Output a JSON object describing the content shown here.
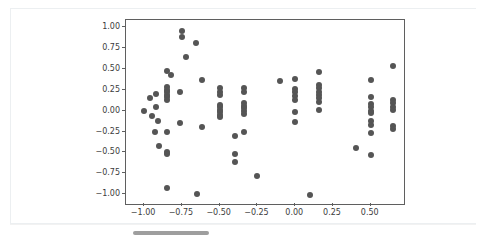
{
  "figure": {
    "background_color": "#ffffff",
    "card_border_color": "#eceff1",
    "axes_border_color": "#5f5f5f",
    "point_color": "#555555",
    "tick_label_color": "#3c3c3c"
  },
  "scrollbar": {
    "name": "horizontal-scrollbar",
    "thumb_color": "#9e9e9e"
  },
  "chart_data": {
    "type": "scatter",
    "title": "",
    "subtitle": "",
    "xlabel": "",
    "ylabel": "",
    "grid": false,
    "legend": null,
    "xlim": [
      -1.12,
      0.72
    ],
    "ylim": [
      -1.12,
      1.09
    ],
    "xticks": [
      -1.0,
      -0.75,
      -0.5,
      -0.25,
      0.0,
      0.25,
      0.5
    ],
    "xticklabels": [
      "−1.00",
      "−0.75",
      "−0.50",
      "−0.25",
      "0.00",
      "0.25",
      "0.50"
    ],
    "yticks": [
      -1.0,
      -0.75,
      -0.5,
      -0.25,
      0.0,
      0.25,
      0.5,
      0.75,
      1.0
    ],
    "yticklabels": [
      "−1.00",
      "−0.75",
      "−0.50",
      "−0.25",
      "0.00",
      "0.25",
      "0.50",
      "0.75",
      "1.00"
    ],
    "marker": "circle",
    "marker_size": 6,
    "marker_color": "#555555",
    "points": [
      [
        -1.0,
        0.0
      ],
      [
        -0.96,
        0.15
      ],
      [
        -0.95,
        -0.06
      ],
      [
        -0.92,
        0.2
      ],
      [
        -0.92,
        0.05
      ],
      [
        -0.91,
        -0.12
      ],
      [
        -0.93,
        -0.25
      ],
      [
        -0.9,
        -0.42
      ],
      [
        -0.85,
        0.48
      ],
      [
        -0.85,
        0.28
      ],
      [
        -0.85,
        0.25
      ],
      [
        -0.85,
        0.22
      ],
      [
        -0.85,
        0.19
      ],
      [
        -0.85,
        0.16
      ],
      [
        -0.85,
        0.13
      ],
      [
        -0.85,
        -0.25
      ],
      [
        -0.85,
        -0.5
      ],
      [
        -0.85,
        -0.52
      ],
      [
        -0.85,
        -0.93
      ],
      [
        -0.82,
        0.43
      ],
      [
        -0.75,
        0.96
      ],
      [
        -0.75,
        0.88
      ],
      [
        -0.76,
        0.22
      ],
      [
        -0.76,
        -0.15
      ],
      [
        -0.72,
        0.65
      ],
      [
        -0.66,
        0.81
      ],
      [
        -0.65,
        -1.0
      ],
      [
        -0.62,
        0.37
      ],
      [
        -0.62,
        -0.2
      ],
      [
        -0.5,
        0.27
      ],
      [
        -0.5,
        0.22
      ],
      [
        -0.5,
        0.19
      ],
      [
        -0.5,
        0.07
      ],
      [
        -0.5,
        0.04
      ],
      [
        -0.5,
        0.01
      ],
      [
        -0.5,
        -0.02
      ],
      [
        -0.5,
        -0.05
      ],
      [
        -0.5,
        -0.08
      ],
      [
        -0.4,
        -0.3
      ],
      [
        -0.4,
        -0.52
      ],
      [
        -0.4,
        -0.61
      ],
      [
        -0.34,
        0.27
      ],
      [
        -0.34,
        0.22
      ],
      [
        -0.34,
        0.09
      ],
      [
        -0.34,
        0.06
      ],
      [
        -0.34,
        0.03
      ],
      [
        -0.34,
        0.0
      ],
      [
        -0.34,
        -0.04
      ],
      [
        -0.34,
        -0.25
      ],
      [
        -0.25,
        -0.78
      ],
      [
        -0.1,
        0.36
      ],
      [
        0.0,
        0.38
      ],
      [
        0.0,
        0.26
      ],
      [
        0.0,
        0.22
      ],
      [
        0.0,
        0.18
      ],
      [
        0.0,
        0.13
      ],
      [
        0.0,
        -0.02
      ],
      [
        0.0,
        -0.14
      ],
      [
        0.1,
        -1.01
      ],
      [
        0.16,
        0.47
      ],
      [
        0.16,
        0.31
      ],
      [
        0.16,
        0.27
      ],
      [
        0.16,
        0.23
      ],
      [
        0.16,
        0.19
      ],
      [
        0.16,
        0.15
      ],
      [
        0.16,
        0.11
      ],
      [
        0.16,
        0.01
      ],
      [
        0.4,
        -0.45
      ],
      [
        0.5,
        0.37
      ],
      [
        0.5,
        0.17
      ],
      [
        0.5,
        0.08
      ],
      [
        0.5,
        0.04
      ],
      [
        0.5,
        0.0
      ],
      [
        0.5,
        -0.03
      ],
      [
        0.5,
        -0.12
      ],
      [
        0.5,
        -0.17
      ],
      [
        0.5,
        -0.27
      ],
      [
        0.5,
        -0.53
      ],
      [
        0.65,
        0.54
      ],
      [
        0.65,
        0.13
      ],
      [
        0.65,
        0.09
      ],
      [
        0.65,
        0.05
      ],
      [
        0.65,
        0.01
      ],
      [
        0.65,
        -0.18
      ],
      [
        0.65,
        -0.22
      ]
    ]
  }
}
